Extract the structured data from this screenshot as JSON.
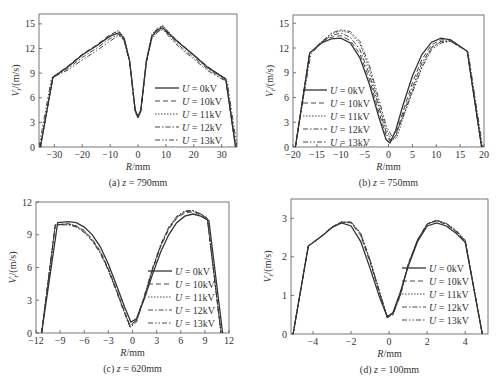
{
  "figure": {
    "series_labels": [
      "U = 0kV",
      "U = 10kV",
      "U = 11kV",
      "U = 12kV",
      "U = 13kV"
    ],
    "line_styles": [
      "solid",
      "dashed",
      "dotted",
      "dashdot",
      "dashdotdot"
    ],
    "line_color": "#333333"
  },
  "chart_data": [
    {
      "type": "line",
      "id": "a",
      "caption": "(a) z = 790mm",
      "xlabel": "R/mm",
      "ylabel": "Vt/(m/s)",
      "xlim": [
        -35.5,
        35.5
      ],
      "ylim": [
        0,
        16.2
      ],
      "xticks": [
        -30,
        -20,
        -10,
        0,
        10,
        20,
        30
      ],
      "yticks": [
        0,
        3,
        6,
        9,
        12,
        15
      ],
      "legend_position": "center-right",
      "box": {
        "x0": 39,
        "x1": 237,
        "y0": 14,
        "y1": 147
      },
      "series": [
        {
          "name": "U = 0kV",
          "x": [
            -35,
            -30.5,
            -25,
            -20,
            -15,
            -10,
            -7,
            -5,
            -3,
            -1,
            0,
            1,
            3,
            5,
            7,
            9,
            12,
            15,
            20,
            25,
            30,
            31.5,
            35
          ],
          "y": [
            0,
            8.5,
            9.8,
            11.2,
            12.3,
            13.5,
            13.9,
            13.2,
            10.5,
            4.5,
            3.7,
            4.5,
            10.5,
            13.5,
            14.3,
            14.5,
            13.5,
            12.6,
            11.2,
            9.7,
            8.6,
            8.3,
            0
          ]
        },
        {
          "name": "U = 10kV",
          "x": [
            -35,
            -30.5,
            -25,
            -20,
            -15,
            -10,
            -7,
            -5,
            -3,
            -1,
            0,
            1,
            3,
            5,
            7,
            9,
            12,
            15,
            20,
            25,
            30,
            31.5,
            35
          ],
          "y": [
            0,
            8.5,
            9.9,
            11.3,
            12.4,
            13.7,
            14.1,
            13.3,
            10.4,
            4.4,
            3.6,
            4.4,
            10.4,
            13.6,
            14.4,
            14.7,
            13.6,
            12.7,
            11.2,
            9.8,
            8.6,
            8.3,
            0
          ]
        },
        {
          "name": "U = 11kV",
          "x": [
            -35,
            -30.5,
            -25,
            -20,
            -15,
            -10,
            -7,
            -5,
            -3,
            -1,
            0,
            1,
            3,
            5,
            7,
            9,
            12,
            15,
            20,
            25,
            30,
            31.5,
            35
          ],
          "y": [
            0,
            8.5,
            9.8,
            11.2,
            12.3,
            13.6,
            14.2,
            13.4,
            10.6,
            4.5,
            3.7,
            4.5,
            10.6,
            13.7,
            14.5,
            14.8,
            13.6,
            12.6,
            11.1,
            9.7,
            8.6,
            8.3,
            0
          ]
        },
        {
          "name": "U = 12kV",
          "x": [
            -35,
            -30.5,
            -25,
            -20,
            -15,
            -10,
            -7,
            -5,
            -3,
            -1,
            0,
            1,
            3,
            5,
            7,
            9,
            12,
            15,
            20,
            25,
            30,
            31.5,
            35
          ],
          "y": [
            0,
            8.4,
            9.6,
            10.9,
            12.0,
            13.2,
            13.7,
            13.0,
            10.3,
            4.3,
            3.5,
            4.3,
            10.3,
            13.3,
            14.1,
            14.4,
            13.3,
            12.3,
            10.9,
            9.5,
            8.4,
            8.1,
            0
          ]
        },
        {
          "name": "U = 13kV",
          "x": [
            -35.5,
            -31,
            -25,
            -20,
            -15,
            -10,
            -7,
            -5,
            -3,
            -1,
            0,
            1,
            3,
            5,
            7,
            9,
            12,
            15,
            20,
            25,
            30,
            32,
            35.5
          ],
          "y": [
            0,
            8.4,
            9.4,
            10.6,
            11.7,
            12.9,
            13.6,
            13.0,
            10.4,
            4.4,
            3.6,
            4.4,
            10.4,
            13.2,
            14.0,
            14.3,
            13.1,
            12.1,
            10.7,
            9.3,
            8.3,
            8.0,
            0
          ]
        }
      ]
    },
    {
      "type": "line",
      "id": "b",
      "caption": "(b) z = 750mm",
      "xlabel": "R/mm",
      "ylabel": "Vt/(m/s)",
      "xlim": [
        -20,
        20
      ],
      "ylim": [
        0,
        16
      ],
      "xticks": [
        -20,
        -15,
        -10,
        -5,
        0,
        5,
        10,
        15,
        20
      ],
      "yticks": [
        0,
        3,
        6,
        9,
        12,
        15
      ],
      "legend_position": "center-left",
      "box": {
        "x0": 293,
        "x1": 484,
        "y0": 15,
        "y1": 147
      },
      "series": [
        {
          "name": "U = 0kV",
          "x": [
            -19.5,
            -16.5,
            -14,
            -12,
            -10,
            -8,
            -6,
            -4,
            -2,
            -0.5,
            0.3,
            1.5,
            3,
            5,
            7,
            9,
            11,
            13,
            16.5,
            19.5
          ],
          "y": [
            0,
            11.4,
            12.6,
            13.1,
            13.2,
            12.6,
            10.8,
            7.6,
            3.6,
            0.9,
            0.5,
            2.0,
            5.0,
            8.6,
            11.2,
            12.7,
            13.2,
            13.0,
            11.6,
            0
          ]
        },
        {
          "name": "U = 10kV",
          "x": [
            -19.5,
            -16.5,
            -14,
            -12,
            -10,
            -8,
            -6,
            -4,
            -2,
            -0.5,
            0.5,
            1.5,
            3,
            5,
            7,
            9,
            11,
            13,
            16.5,
            19.5
          ],
          "y": [
            0,
            11.4,
            12.7,
            13.3,
            13.5,
            12.9,
            11.3,
            8.2,
            4.2,
            1.4,
            0.6,
            1.4,
            4.2,
            7.8,
            10.6,
            12.4,
            13.0,
            13.0,
            11.6,
            0
          ]
        },
        {
          "name": "U = 11kV",
          "x": [
            -19.5,
            -16.5,
            -14,
            -12,
            -10,
            -8,
            -6,
            -4,
            -2,
            -0.5,
            0.7,
            1.8,
            3,
            5,
            7,
            9,
            11,
            13,
            16.5,
            19.5
          ],
          "y": [
            0,
            11.4,
            12.8,
            13.7,
            14.1,
            13.8,
            12.5,
            9.5,
            5.2,
            2.2,
            0.8,
            1.2,
            3.4,
            6.8,
            9.8,
            12.0,
            12.8,
            12.9,
            11.6,
            0
          ]
        },
        {
          "name": "U = 12kV",
          "x": [
            -19.5,
            -16.5,
            -14,
            -12,
            -10,
            -8,
            -6,
            -4,
            -2,
            -0.5,
            0.5,
            1.5,
            3,
            5,
            7,
            9,
            11,
            13,
            16.5,
            19.5
          ],
          "y": [
            0,
            11.4,
            12.7,
            13.5,
            13.8,
            13.3,
            11.8,
            8.8,
            4.8,
            1.8,
            0.7,
            1.3,
            3.8,
            7.2,
            10.2,
            12.1,
            12.8,
            12.8,
            11.6,
            0
          ]
        },
        {
          "name": "U = 13kV",
          "x": [
            -19.5,
            -16.3,
            -14,
            -12,
            -10,
            -8,
            -6,
            -4,
            -2,
            -0.5,
            0.8,
            2,
            3,
            5,
            7,
            9,
            11,
            13,
            16.7,
            19.7
          ],
          "y": [
            0,
            11.2,
            12.7,
            13.8,
            14.2,
            14.0,
            12.8,
            9.9,
            5.8,
            2.6,
            1.2,
            2.3,
            3.6,
            6.6,
            9.6,
            11.8,
            12.6,
            12.8,
            11.5,
            0
          ]
        }
      ]
    },
    {
      "type": "line",
      "id": "c",
      "caption": "(c) z = 620mm",
      "xlabel": "R/mm",
      "ylabel": "Vt/(m/s)",
      "xlim": [
        -12,
        12
      ],
      "ylim": [
        0,
        12
      ],
      "xticks": [
        -12,
        -9,
        -6,
        -3,
        0,
        3,
        6,
        9,
        12
      ],
      "yticks": [
        0,
        3,
        6,
        9,
        12
      ],
      "legend_position": "center-right",
      "box": {
        "x0": 36,
        "x1": 229,
        "y0": 202,
        "y1": 333
      },
      "series": [
        {
          "name": "U = 0kV",
          "x": [
            -11.3,
            -9.3,
            -8,
            -7,
            -6,
            -5,
            -4,
            -3,
            -2,
            -1,
            -0.2,
            0.5,
            1.5,
            2.5,
            3.5,
            4.5,
            5.5,
            6.5,
            7.5,
            8.5,
            9.5,
            11.2
          ],
          "y": [
            0,
            10.1,
            10.2,
            10.1,
            9.7,
            9.0,
            7.9,
            6.3,
            4.4,
            2.4,
            1.0,
            1.3,
            3.2,
            5.4,
            7.4,
            9.0,
            10.1,
            10.7,
            10.9,
            10.7,
            10.3,
            0
          ]
        },
        {
          "name": "U = 10kV",
          "x": [
            -11.3,
            -9.6,
            -8,
            -7,
            -6,
            -5,
            -4,
            -3,
            -2,
            -1,
            -0.3,
            0.5,
            1.5,
            2.5,
            3.5,
            4.5,
            5.5,
            6.5,
            7.5,
            8.5,
            9.3,
            11
          ],
          "y": [
            0,
            9.9,
            10.0,
            9.8,
            9.4,
            8.6,
            7.5,
            5.9,
            4.0,
            2.0,
            0.7,
            1.2,
            3.4,
            5.8,
            7.9,
            9.5,
            10.5,
            11.0,
            11.1,
            10.8,
            10.5,
            0
          ]
        },
        {
          "name": "U = 11kV",
          "x": [
            -11.3,
            -9.6,
            -8,
            -7,
            -6,
            -5,
            -4,
            -3,
            -2,
            -1,
            -0.3,
            0.5,
            1.5,
            2.5,
            3.5,
            4.5,
            5.5,
            6.5,
            7.5,
            8.5,
            9.3,
            11
          ],
          "y": [
            0,
            9.9,
            10.0,
            9.8,
            9.3,
            8.5,
            7.4,
            5.8,
            3.9,
            1.9,
            0.6,
            1.1,
            3.4,
            5.9,
            8.0,
            9.6,
            10.6,
            11.1,
            11.2,
            10.9,
            10.5,
            0
          ]
        },
        {
          "name": "U = 12kV",
          "x": [
            -11.3,
            -9.6,
            -8,
            -7,
            -6,
            -5,
            -4,
            -3,
            -2,
            -1,
            -0.3,
            0.5,
            1.5,
            2.5,
            3.5,
            4.5,
            5.5,
            6.5,
            7.5,
            8.5,
            9.3,
            11
          ],
          "y": [
            0,
            9.9,
            9.9,
            9.7,
            9.2,
            8.4,
            7.3,
            5.7,
            3.8,
            1.8,
            0.5,
            1.0,
            3.3,
            5.8,
            8.0,
            9.6,
            10.6,
            11.1,
            11.2,
            10.9,
            10.5,
            0
          ]
        },
        {
          "name": "U = 13kV",
          "x": [
            -11.3,
            -9.6,
            -8,
            -7,
            -6,
            -5,
            -4,
            -3,
            -2,
            -1,
            -0.3,
            0.5,
            1.5,
            2.5,
            3.5,
            4.5,
            5.5,
            6.5,
            7.5,
            8.5,
            9.3,
            11
          ],
          "y": [
            0,
            9.9,
            10.0,
            9.8,
            9.3,
            8.5,
            7.4,
            5.8,
            3.9,
            1.9,
            0.6,
            1.2,
            3.5,
            6.0,
            8.1,
            9.7,
            10.7,
            11.2,
            11.2,
            10.9,
            10.5,
            0
          ]
        }
      ]
    },
    {
      "type": "line",
      "id": "d",
      "caption": "(d) z = 100mm",
      "xlabel": "R/mm",
      "ylabel": "Vt/(m/s)",
      "xlim": [
        -5.16,
        5.2
      ],
      "ylim": [
        0,
        3.5
      ],
      "xticks": [
        -4,
        -2,
        0,
        2,
        4
      ],
      "yticks": [
        0,
        1,
        2,
        3
      ],
      "legend_position": "center-right",
      "box": {
        "x0": 291,
        "x1": 488,
        "y0": 199,
        "y1": 334
      },
      "series": [
        {
          "name": "U = 0kV",
          "x": [
            -5.05,
            -4.25,
            -3.5,
            -3,
            -2.5,
            -2,
            -1.5,
            -1,
            -0.5,
            -0.1,
            0.2,
            0.6,
            1,
            1.5,
            2,
            2.5,
            3,
            3.5,
            4,
            4.9
          ],
          "y": [
            0,
            2.28,
            2.55,
            2.76,
            2.88,
            2.8,
            2.4,
            1.7,
            0.95,
            0.45,
            0.55,
            1.1,
            1.75,
            2.4,
            2.8,
            2.88,
            2.8,
            2.62,
            2.38,
            0
          ]
        },
        {
          "name": "U = 10kV",
          "x": [
            -5.05,
            -4.25,
            -3.5,
            -3,
            -2.5,
            -2,
            -1.5,
            -1,
            -0.5,
            -0.1,
            0.2,
            0.6,
            1,
            1.5,
            2,
            2.5,
            3,
            3.5,
            4,
            4.9
          ],
          "y": [
            0,
            2.28,
            2.56,
            2.78,
            2.9,
            2.88,
            2.55,
            1.85,
            1.05,
            0.42,
            0.5,
            1.05,
            1.8,
            2.45,
            2.85,
            2.93,
            2.84,
            2.66,
            2.4,
            0
          ]
        },
        {
          "name": "U = 11kV",
          "x": [
            -5.05,
            -4.25,
            -3.5,
            -3,
            -2.5,
            -2,
            -1.5,
            -1,
            -0.5,
            -0.1,
            0.2,
            0.6,
            1,
            1.5,
            2,
            2.5,
            3,
            3.5,
            4,
            4.9
          ],
          "y": [
            0,
            2.28,
            2.56,
            2.78,
            2.9,
            2.9,
            2.6,
            1.9,
            1.08,
            0.44,
            0.52,
            1.05,
            1.8,
            2.45,
            2.86,
            2.95,
            2.86,
            2.68,
            2.42,
            0
          ]
        },
        {
          "name": "U = 12kV",
          "x": [
            -5.05,
            -4.25,
            -3.5,
            -3,
            -2.5,
            -2,
            -1.5,
            -1,
            -0.5,
            -0.1,
            0.2,
            0.6,
            1,
            1.5,
            2,
            2.5,
            3,
            3.5,
            4,
            4.9
          ],
          "y": [
            0,
            2.28,
            2.56,
            2.77,
            2.9,
            2.9,
            2.6,
            1.9,
            1.07,
            0.43,
            0.5,
            1.0,
            1.78,
            2.44,
            2.85,
            2.94,
            2.86,
            2.68,
            2.42,
            0
          ]
        },
        {
          "name": "U = 13kV",
          "x": [
            -5.05,
            -4.25,
            -3.5,
            -3,
            -2.5,
            -2,
            -1.5,
            -1,
            -0.5,
            -0.1,
            0.2,
            0.6,
            1,
            1.5,
            2,
            2.5,
            3,
            3.5,
            4,
            4.9
          ],
          "y": [
            0,
            2.28,
            2.55,
            2.77,
            2.9,
            2.9,
            2.62,
            1.92,
            1.1,
            0.46,
            0.52,
            1.02,
            1.78,
            2.44,
            2.86,
            2.95,
            2.87,
            2.7,
            2.44,
            0
          ]
        }
      ]
    }
  ]
}
